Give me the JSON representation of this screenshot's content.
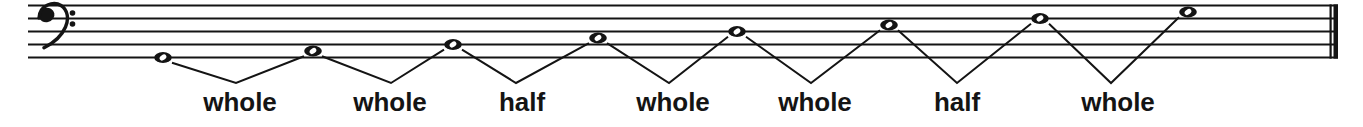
{
  "colors": {
    "ink": "#141414",
    "paper": "#ffffff"
  },
  "staff": {
    "clef": "bass",
    "line_count": 5,
    "x_start": 28,
    "x_end": 1338,
    "y_top": 5.5,
    "line_spacing": 13,
    "line_thickness": 2.2,
    "final_barline": {
      "thin_x": 1329.5,
      "thin_w": 2.2,
      "thick_x": 1333.5,
      "thick_w": 4.5
    }
  },
  "clef_marks": {
    "ball_cx": 46.5,
    "ball_cy": 15,
    "dot_x": 72.5,
    "dot_y_upper": 13,
    "dot_y_lower": 24,
    "dot_r": 2.8
  },
  "notes": [
    {
      "x": 163,
      "step": 0,
      "pitch": "G2",
      "type": "whole-note"
    },
    {
      "x": 313,
      "step": 1,
      "pitch": "A2",
      "type": "whole-note"
    },
    {
      "x": 453,
      "step": 2,
      "pitch": "B2",
      "type": "whole-note"
    },
    {
      "x": 598,
      "step": 3,
      "pitch": "C3",
      "type": "whole-note"
    },
    {
      "x": 737,
      "step": 4,
      "pitch": "D3",
      "type": "whole-note"
    },
    {
      "x": 889,
      "step": 5,
      "pitch": "E3",
      "type": "whole-note"
    },
    {
      "x": 1040,
      "step": 6,
      "pitch": "F3",
      "type": "whole-note"
    },
    {
      "x": 1188,
      "step": 7,
      "pitch": "G3",
      "type": "whole-note"
    }
  ],
  "note_style": {
    "rx": 8.8,
    "ry": 5.4,
    "hole_rx": 3.7,
    "hole_ry": 2.5,
    "hole_angle": -35
  },
  "intervals": [
    {
      "from": 0,
      "to": 1,
      "label": "whole",
      "vertex_x": 236,
      "label_x": 240
    },
    {
      "from": 1,
      "to": 2,
      "label": "whole",
      "vertex_x": 391,
      "label_x": 390
    },
    {
      "from": 2,
      "to": 3,
      "label": "half",
      "vertex_x": 516,
      "label_x": 522
    },
    {
      "from": 3,
      "to": 4,
      "label": "whole",
      "vertex_x": 669,
      "label_x": 673
    },
    {
      "from": 4,
      "to": 5,
      "label": "whole",
      "vertex_x": 811,
      "label_x": 815
    },
    {
      "from": 5,
      "to": 6,
      "label": "half",
      "vertex_x": 957,
      "label_x": 957
    },
    {
      "from": 6,
      "to": 7,
      "label": "whole",
      "vertex_x": 1111,
      "label_x": 1118
    }
  ],
  "interval_style": {
    "vertex_y": 83,
    "line_thickness": 2,
    "label_baseline_y": 111,
    "note_attach_dx": 9,
    "note_attach_dy": 5.2
  },
  "scale_pattern": "whole whole half whole whole half whole"
}
